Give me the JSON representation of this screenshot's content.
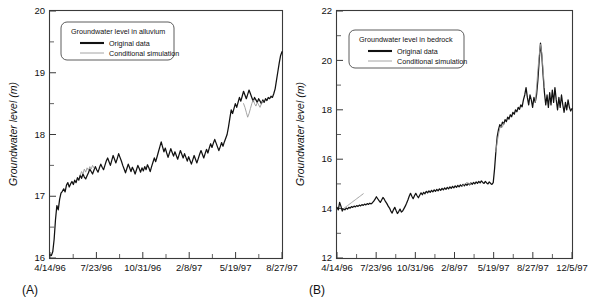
{
  "figure": {
    "panel_a_tag": "(A)",
    "panel_b_tag": "(B)"
  },
  "chart_data": [
    {
      "id": "panel_a",
      "type": "line",
      "title": "",
      "panel_label": "(A)",
      "xlabel": "",
      "ylabel": "Groundwater level (m)",
      "ylim": [
        16,
        20
      ],
      "yticks": [
        16,
        17,
        18,
        19,
        20
      ],
      "yminor_step": 0.5,
      "grid": false,
      "legend_position": "top-left",
      "legend_title": "Groundwater level in alluvium",
      "xtick_labels": [
        "4/14/96",
        "7/23/96",
        "10/31/96",
        "2/8/97",
        "5/19/97",
        "8/27/97"
      ],
      "xlim_labels": [
        "4/14/96",
        "8/27/97"
      ],
      "xminor_per_interval": 1,
      "series": [
        {
          "name": "Original data",
          "color": "#111111",
          "values": [
            16.05,
            16.04,
            16.1,
            16.3,
            16.62,
            16.85,
            16.78,
            16.95,
            17.05,
            17.08,
            17.12,
            17.07,
            17.18,
            17.22,
            17.15,
            17.2,
            17.24,
            17.19,
            17.26,
            17.22,
            17.3,
            17.26,
            17.34,
            17.29,
            17.36,
            17.31,
            17.28,
            17.33,
            17.38,
            17.44,
            17.4,
            17.36,
            17.42,
            17.48,
            17.43,
            17.39,
            17.46,
            17.52,
            17.47,
            17.43,
            17.5,
            17.57,
            17.62,
            17.56,
            17.5,
            17.58,
            17.66,
            17.6,
            17.54,
            17.61,
            17.69,
            17.63,
            17.57,
            17.5,
            17.44,
            17.38,
            17.45,
            17.52,
            17.46,
            17.4,
            17.47,
            17.42,
            17.36,
            17.43,
            17.5,
            17.45,
            17.39,
            17.46,
            17.41,
            17.48,
            17.43,
            17.51,
            17.46,
            17.4,
            17.48,
            17.55,
            17.62,
            17.56,
            17.64,
            17.72,
            17.8,
            17.88,
            17.8,
            17.72,
            17.78,
            17.7,
            17.63,
            17.7,
            17.77,
            17.71,
            17.65,
            17.72,
            17.66,
            17.6,
            17.67,
            17.74,
            17.68,
            17.62,
            17.69,
            17.63,
            17.57,
            17.64,
            17.58,
            17.52,
            17.59,
            17.66,
            17.6,
            17.54,
            17.61,
            17.68,
            17.74,
            17.68,
            17.62,
            17.69,
            17.76,
            17.7,
            17.78,
            17.85,
            17.79,
            17.86,
            17.92,
            17.86,
            17.8,
            17.74,
            17.8,
            17.87,
            17.81,
            17.88,
            17.94,
            18.0,
            18.12,
            18.26,
            18.4,
            18.34,
            18.42,
            18.5,
            18.44,
            18.52,
            18.6,
            18.54,
            18.62,
            18.7,
            18.64,
            18.58,
            18.65,
            18.72,
            18.66,
            18.6,
            18.54,
            18.6,
            18.56,
            18.52,
            18.58,
            18.54,
            18.5,
            18.56,
            18.52,
            18.58,
            18.55,
            18.6,
            18.58,
            18.62,
            18.6,
            18.66,
            18.74,
            18.88,
            19.02,
            19.16,
            19.28,
            19.34
          ]
        },
        {
          "name": "Conditional simulation",
          "color": "#9a9a9a",
          "segments": [
            {
              "start_index": 22,
              "values": [
                17.34,
                17.4,
                17.36,
                17.44,
                17.39,
                17.46,
                17.42,
                17.48,
                17.44,
                17.5,
                17.46
              ]
            },
            {
              "start_index": 141,
              "values": [
                18.5,
                18.44,
                18.36,
                18.28,
                18.34,
                18.42,
                18.5,
                18.56,
                18.5,
                18.46,
                18.52,
                18.48,
                18.44,
                18.5,
                18.54
              ]
            }
          ]
        }
      ]
    },
    {
      "id": "panel_b",
      "type": "line",
      "title": "",
      "panel_label": "(B)",
      "xlabel": "",
      "ylabel": "Groundwater level (m)",
      "ylim": [
        12,
        22
      ],
      "yticks": [
        12,
        14,
        16,
        18,
        20,
        22
      ],
      "yminor_step": 1,
      "grid": false,
      "legend_position": "top-left",
      "legend_title": "Groundwater level in bedrock",
      "xtick_labels": [
        "4/14/96",
        "7/23/96",
        "10/31/96",
        "2/8/97",
        "5/19/97",
        "8/27/97",
        "12/5/97"
      ],
      "xlim_labels": [
        "4/14/96",
        "12/5/97"
      ],
      "xminor_per_interval": 1,
      "series": [
        {
          "name": "Original data",
          "color": "#111111",
          "values": [
            14.05,
            13.95,
            14.25,
            14.1,
            13.9,
            14.0,
            13.95,
            14.02,
            13.98,
            14.05,
            14.02,
            14.08,
            14.05,
            14.1,
            14.07,
            14.12,
            14.09,
            14.14,
            14.11,
            14.16,
            14.13,
            14.18,
            14.15,
            14.2,
            14.17,
            14.22,
            14.19,
            14.24,
            14.3,
            14.38,
            14.48,
            14.4,
            14.32,
            14.25,
            14.35,
            14.45,
            14.38,
            14.28,
            14.2,
            14.1,
            14.02,
            13.9,
            13.82,
            13.95,
            14.05,
            13.92,
            13.8,
            13.88,
            13.98,
            13.86,
            13.9,
            14.0,
            14.1,
            14.22,
            14.35,
            14.5,
            14.62,
            14.5,
            14.4,
            14.52,
            14.62,
            14.52,
            14.44,
            14.54,
            14.64,
            14.56,
            14.66,
            14.6,
            14.7,
            14.64,
            14.72,
            14.66,
            14.74,
            14.68,
            14.76,
            14.7,
            14.78,
            14.72,
            14.8,
            14.74,
            14.82,
            14.76,
            14.84,
            14.78,
            14.86,
            14.8,
            14.88,
            14.82,
            14.9,
            14.84,
            14.92,
            14.86,
            14.94,
            14.88,
            14.96,
            14.9,
            14.98,
            14.92,
            15.0,
            14.94,
            15.02,
            14.96,
            15.04,
            14.98,
            15.06,
            15.0,
            15.08,
            15.02,
            15.1,
            15.04,
            15.12,
            15.06,
            15.02,
            15.1,
            15.04,
            15.0,
            15.08,
            15.02,
            14.98,
            15.05,
            15.6,
            16.3,
            16.9,
            17.2,
            17.4,
            17.3,
            17.5,
            17.42,
            17.6,
            17.52,
            17.7,
            17.62,
            17.8,
            17.72,
            17.9,
            17.82,
            18.0,
            17.92,
            18.1,
            18.02,
            18.2,
            18.12,
            18.4,
            18.6,
            18.9,
            18.5,
            18.2,
            18.6,
            18.4,
            18.1,
            18.5,
            18.3,
            18.6,
            19.2,
            20.0,
            20.7,
            20.2,
            19.4,
            18.7,
            18.2,
            18.6,
            18.1,
            18.7,
            18.2,
            18.8,
            18.3,
            18.9,
            18.4,
            18.0,
            18.5,
            18.1,
            18.6,
            18.2,
            17.9,
            18.3,
            18.0,
            18.4,
            18.1,
            17.95,
            18.05
          ]
        },
        {
          "name": "Conditional simulation",
          "color": "#9a9a9a",
          "segments": [
            {
              "start_index": 5,
              "values": [
                14.0,
                14.04,
                14.08,
                14.12,
                14.16,
                14.2,
                14.24,
                14.28,
                14.32,
                14.36,
                14.4,
                14.44,
                14.48,
                14.52,
                14.56,
                14.6
              ]
            },
            {
              "start_index": 95,
              "values": [
                14.9,
                14.94,
                14.98,
                15.02,
                15.06,
                15.02,
                14.98,
                15.04
              ]
            },
            {
              "start_index": 121,
              "values": [
                16.3,
                16.7,
                17.0,
                17.25,
                17.35,
                17.3,
                17.45
              ]
            },
            {
              "start_index": 151,
              "values": [
                18.3,
                18.9,
                19.6,
                20.2,
                20.65,
                20.3,
                19.6,
                18.9
              ]
            }
          ]
        }
      ]
    }
  ]
}
